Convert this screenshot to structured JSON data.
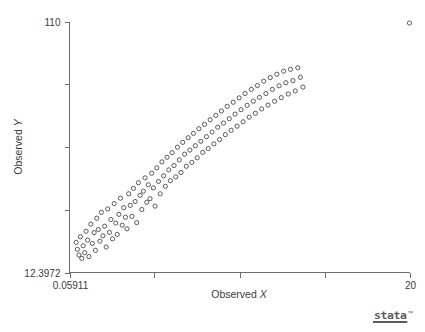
{
  "figure": {
    "background_color": "#ffffff",
    "axis_color": "#6e6e6e",
    "marker_color": "#4a4a4a",
    "text_color": "#3c3c3c",
    "top_clipped_text": "",
    "branding": {
      "wordmark": "stata",
      "trademark": "™"
    }
  },
  "chart_data": {
    "type": "scatter",
    "title": "",
    "xlabel": "Observed X",
    "ylabel": "Observed Y",
    "xlim": [
      0.05911,
      20
    ],
    "ylim": [
      12.3972,
      110
    ],
    "xticks": [
      0.05911,
      5.04,
      10.03,
      15.02,
      20
    ],
    "xtick_labels": [
      "0.05911",
      "",
      "",
      "",
      "20"
    ],
    "yticks": [
      12.3972,
      36.8,
      61.2,
      85.6,
      110
    ],
    "ytick_labels": [
      "12.3972",
      "",
      "",
      "",
      "110"
    ],
    "grid": false,
    "legend": null,
    "marker": {
      "shape": "circle-open",
      "radius_px": 2.1,
      "stroke_width": 0.9
    },
    "series": [
      {
        "name": "observations",
        "points": [
          [
            0.45,
            24.1
          ],
          [
            0.52,
            21.4
          ],
          [
            0.61,
            19.2
          ],
          [
            0.7,
            26.3
          ],
          [
            0.78,
            17.9
          ],
          [
            0.86,
            22.8
          ],
          [
            0.95,
            20.1
          ],
          [
            1.03,
            28.4
          ],
          [
            1.12,
            25.0
          ],
          [
            1.2,
            18.6
          ],
          [
            1.31,
            31.2
          ],
          [
            1.4,
            23.7
          ],
          [
            1.5,
            27.9
          ],
          [
            1.58,
            21.0
          ],
          [
            1.66,
            33.5
          ],
          [
            1.75,
            29.1
          ],
          [
            1.84,
            24.6
          ],
          [
            1.93,
            35.8
          ],
          [
            2.02,
            26.7
          ],
          [
            2.12,
            30.4
          ],
          [
            2.21,
            22.3
          ],
          [
            2.3,
            37.1
          ],
          [
            2.4,
            28.0
          ],
          [
            2.49,
            33.0
          ],
          [
            2.58,
            25.5
          ],
          [
            2.68,
            39.2
          ],
          [
            2.77,
            31.6
          ],
          [
            2.86,
            27.2
          ],
          [
            2.96,
            35.0
          ],
          [
            3.05,
            41.3
          ],
          [
            3.15,
            30.8
          ],
          [
            3.24,
            37.6
          ],
          [
            3.34,
            33.9
          ],
          [
            3.43,
            29.4
          ],
          [
            3.53,
            43.0
          ],
          [
            3.62,
            38.5
          ],
          [
            3.72,
            34.2
          ],
          [
            3.81,
            45.1
          ],
          [
            3.91,
            40.0
          ],
          [
            4.0,
            31.8
          ],
          [
            4.1,
            47.3
          ],
          [
            4.2,
            42.4
          ],
          [
            4.3,
            36.9
          ],
          [
            4.39,
            44.0
          ],
          [
            4.49,
            49.2
          ],
          [
            4.59,
            39.7
          ],
          [
            4.68,
            46.5
          ],
          [
            4.78,
            41.1
          ],
          [
            4.88,
            51.0
          ],
          [
            4.98,
            45.3
          ],
          [
            5.08,
            38.2
          ],
          [
            5.18,
            53.1
          ],
          [
            5.28,
            47.8
          ],
          [
            5.38,
            43.0
          ],
          [
            5.48,
            55.4
          ],
          [
            5.58,
            50.0
          ],
          [
            5.68,
            45.9
          ],
          [
            5.78,
            57.2
          ],
          [
            5.88,
            52.3
          ],
          [
            5.98,
            48.1
          ],
          [
            6.08,
            59.0
          ],
          [
            6.19,
            54.0
          ],
          [
            6.29,
            49.6
          ],
          [
            6.39,
            61.1
          ],
          [
            6.5,
            56.2
          ],
          [
            6.6,
            51.3
          ],
          [
            6.7,
            63.0
          ],
          [
            6.81,
            58.4
          ],
          [
            6.91,
            53.7
          ],
          [
            7.02,
            64.8
          ],
          [
            7.12,
            60.0
          ],
          [
            7.23,
            55.2
          ],
          [
            7.33,
            66.5
          ],
          [
            7.44,
            61.7
          ],
          [
            7.55,
            57.0
          ],
          [
            7.65,
            68.3
          ],
          [
            7.76,
            63.4
          ],
          [
            7.87,
            59.1
          ],
          [
            7.98,
            70.0
          ],
          [
            8.09,
            65.2
          ],
          [
            8.2,
            60.6
          ],
          [
            8.31,
            71.8
          ],
          [
            8.42,
            67.0
          ],
          [
            8.53,
            62.4
          ],
          [
            8.64,
            73.5
          ],
          [
            8.75,
            68.9
          ],
          [
            8.86,
            64.1
          ],
          [
            8.97,
            75.2
          ],
          [
            9.09,
            70.5
          ],
          [
            9.2,
            66.0
          ],
          [
            9.31,
            77.0
          ],
          [
            9.43,
            72.2
          ],
          [
            9.54,
            67.7
          ],
          [
            9.66,
            78.6
          ],
          [
            9.77,
            74.0
          ],
          [
            9.89,
            69.3
          ],
          [
            10.01,
            80.3
          ],
          [
            10.12,
            75.7
          ],
          [
            10.24,
            71.0
          ],
          [
            10.36,
            82.0
          ],
          [
            10.48,
            77.4
          ],
          [
            10.6,
            72.8
          ],
          [
            10.72,
            83.6
          ],
          [
            10.84,
            79.0
          ],
          [
            10.96,
            74.3
          ],
          [
            11.08,
            85.1
          ],
          [
            11.2,
            80.5
          ],
          [
            11.33,
            76.0
          ],
          [
            11.45,
            86.8
          ],
          [
            11.58,
            82.0
          ],
          [
            11.7,
            77.5
          ],
          [
            11.83,
            88.2
          ],
          [
            11.96,
            83.6
          ],
          [
            12.09,
            79.0
          ],
          [
            12.22,
            89.5
          ],
          [
            12.35,
            85.0
          ],
          [
            12.48,
            80.4
          ],
          [
            12.62,
            90.7
          ],
          [
            12.75,
            86.2
          ],
          [
            12.89,
            81.8
          ],
          [
            13.02,
            91.4
          ],
          [
            13.16,
            87.0
          ],
          [
            13.3,
            83.0
          ],
          [
            13.45,
            92.0
          ],
          [
            13.6,
            88.3
          ],
          [
            13.75,
            84.5
          ],
          [
            20.0,
            109.4
          ]
        ]
      }
    ],
    "annotations": [
      {
        "kind": "outlier",
        "x": 20,
        "y": 109.4,
        "note": "isolated point at upper-right corner"
      }
    ]
  }
}
